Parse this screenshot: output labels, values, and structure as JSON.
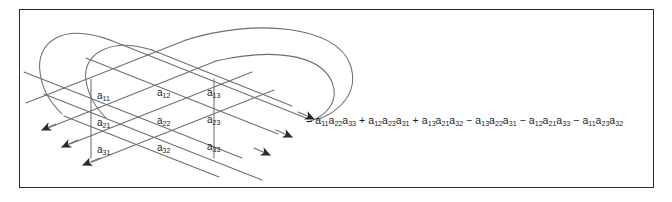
{
  "figure": {
    "frame_border_color": "#2b2b2b",
    "line_color": "#6e6e6e",
    "text_color": "#1c1c1c",
    "background_color": "#ffffff"
  },
  "matrix": {
    "description": "3 by 3 matrix of entries a_ij shown between two vertical determinant bars",
    "rows": [
      [
        {
          "base": "a",
          "sub": "11"
        },
        {
          "base": "a",
          "sub": "12"
        },
        {
          "base": "a",
          "sub": "13"
        }
      ],
      [
        {
          "base": "a",
          "sub": "21"
        },
        {
          "base": "a",
          "sub": "22"
        },
        {
          "base": "a",
          "sub": "23"
        }
      ],
      [
        {
          "base": "a",
          "sub": "31"
        },
        {
          "base": "a",
          "sub": "32"
        },
        {
          "base": "a",
          "sub": "33"
        }
      ]
    ],
    "entries_flat": [
      "a11",
      "a12",
      "a13",
      "a21",
      "a22",
      "a23",
      "a31",
      "a32",
      "a33"
    ]
  },
  "formula": {
    "equals": "=",
    "terms": [
      {
        "sign": "",
        "factors": [
          "a11",
          "a22",
          "a33"
        ]
      },
      {
        "sign": "+",
        "factors": [
          "a12",
          "a23",
          "a31"
        ]
      },
      {
        "sign": "+",
        "factors": [
          "a13",
          "a21",
          "a32"
        ]
      },
      {
        "sign": "−",
        "factors": [
          "a13",
          "a22",
          "a31"
        ]
      },
      {
        "sign": "−",
        "factors": [
          "a12",
          "a21",
          "a33"
        ]
      },
      {
        "sign": "−",
        "factors": [
          "a11",
          "a23",
          "a32"
        ]
      }
    ],
    "plain_text": "= a11a22a33 + a12a23a31 + a13a21a32 − a13a22a31 − a12a21a33 − a11a23a32"
  },
  "diagram": {
    "arrow_count": 6,
    "arc_count": 4,
    "vertical_bar_count": 2
  }
}
